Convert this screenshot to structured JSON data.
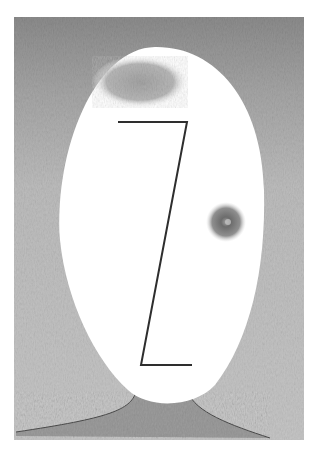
{
  "artwork": {
    "subject": "Abstract pencil drawing of an egg-shaped face",
    "colors": {
      "paper": "#ffffff",
      "background_top": "#8e8e8e",
      "background_mid": "#b9b9b9",
      "background_low": "#c4c4c4",
      "face": "#ffffff",
      "forehead_shading": "#a9a9a9",
      "neck": "#9a9a9a",
      "line": "#2e2e2e",
      "eye_outer": "#bdbdbd",
      "eye_inner": "#6f6f6f"
    },
    "frame": {
      "x": 14,
      "y": 17,
      "width": 290,
      "height": 423
    },
    "features": {
      "nose_mouth_line": "Z-shaped stroke",
      "eye": "single shaded circular eye on the right side",
      "neck": "dark shaded neck with curved shoulders"
    }
  }
}
